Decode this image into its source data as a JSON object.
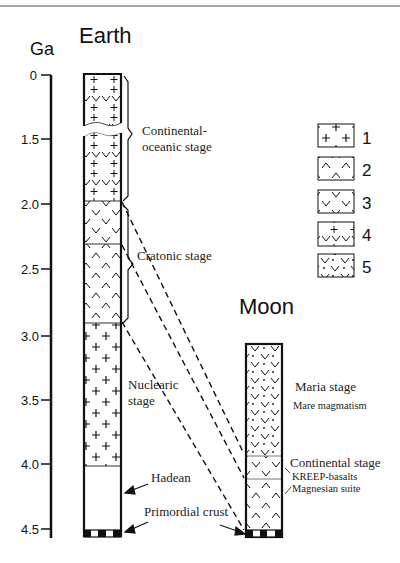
{
  "axis": {
    "unit_label": "Ga",
    "ticks": [
      {
        "label": "0",
        "value": 0
      },
      {
        "label": "1.5",
        "value": 1.5
      },
      {
        "label": "2.0",
        "value": 2.0
      },
      {
        "label": "2.5",
        "value": 2.5
      },
      {
        "label": "3.0",
        "value": 3.0
      },
      {
        "label": "3.5",
        "value": 3.5
      },
      {
        "label": "4.0",
        "value": 4.0
      },
      {
        "label": "4.5",
        "value": 4.5
      }
    ]
  },
  "earth": {
    "title": "Earth",
    "stages": [
      {
        "label_line1": "Continental-",
        "label_line2": "oceanic stage",
        "from_ga": 0,
        "to_ga": 2.0
      },
      {
        "label_line1": "Cratonic stage",
        "from_ga": 2.0,
        "to_ga": 2.85
      },
      {
        "label_line1": "Nuclearic",
        "label_line2": "stage",
        "from_ga": 2.85,
        "to_ga": 4.0
      }
    ],
    "hadean_label": "Hadean",
    "primordial_label": "Primordial crust"
  },
  "moon": {
    "title": "Moon",
    "maria_stage": "Maria stage",
    "mare_magmatism": "Mare magmatism",
    "continental_stage": "Continental stage",
    "kreep": "KREEP-basalts",
    "magnesian": "Magnesian suite"
  },
  "legend": {
    "items": [
      {
        "number": "1",
        "pattern": "crosses"
      },
      {
        "number": "2",
        "pattern": "carets"
      },
      {
        "number": "3",
        "pattern": "v-marks"
      },
      {
        "number": "4",
        "pattern": "v-marks-with-crosses"
      },
      {
        "number": "5",
        "pattern": "v-marks-with-dots"
      }
    ]
  }
}
